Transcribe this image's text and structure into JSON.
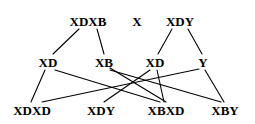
{
  "diagram": {
    "type": "derivation-lattice",
    "width": 255,
    "height": 124,
    "background_color": "#ffffff",
    "edge_color": "#000000",
    "text_color": "#000000",
    "rows": [
      {
        "name": "top-row",
        "y": 21,
        "nodes": [
          {
            "id": "n-xdxb",
            "label": "XDXB",
            "x": 88,
            "y": 21
          },
          {
            "id": "n-x",
            "label": "X",
            "x": 137,
            "y": 21
          },
          {
            "id": "n-xdy-top",
            "label": "XDY",
            "x": 180,
            "y": 21
          }
        ]
      },
      {
        "name": "middle-row",
        "y": 62,
        "nodes": [
          {
            "id": "n-xd-left",
            "label": "XD",
            "x": 48,
            "y": 62
          },
          {
            "id": "n-xb",
            "label": "XB",
            "x": 104,
            "y": 62
          },
          {
            "id": "n-xd-right",
            "label": "XD",
            "x": 155,
            "y": 62
          },
          {
            "id": "n-y",
            "label": "Y",
            "x": 203,
            "y": 62
          }
        ]
      },
      {
        "name": "bottom-row",
        "y": 110,
        "nodes": [
          {
            "id": "n-xdxd",
            "label": "XDXD",
            "x": 32,
            "y": 110
          },
          {
            "id": "n-xdy-bottom",
            "label": "XDY",
            "x": 101,
            "y": 110
          },
          {
            "id": "n-xbxd",
            "label": "XBXD",
            "x": 166,
            "y": 110
          },
          {
            "id": "n-xby",
            "label": "XBY",
            "x": 225,
            "y": 110
          }
        ]
      }
    ],
    "edges": [
      {
        "id": "e-1",
        "from": "n-xdxb",
        "to": "n-xd-left",
        "x1": 79,
        "y1": 29,
        "x2": 53,
        "y2": 54
      },
      {
        "id": "e-2",
        "from": "n-xdxb",
        "to": "n-xb",
        "x1": 97,
        "y1": 29,
        "x2": 104,
        "y2": 54
      },
      {
        "id": "e-3",
        "from": "n-xdy-top",
        "to": "n-xd-right",
        "x1": 172,
        "y1": 29,
        "x2": 158,
        "y2": 54
      },
      {
        "id": "e-4",
        "from": "n-xdy-top",
        "to": "n-y",
        "x1": 188,
        "y1": 29,
        "x2": 202,
        "y2": 54
      },
      {
        "id": "e-5",
        "from": "n-xd-left",
        "to": "n-xdxd",
        "x1": 45,
        "y1": 70,
        "x2": 31,
        "y2": 102
      },
      {
        "id": "e-6",
        "from": "n-xd-left",
        "to": "n-xbxd",
        "x1": 55,
        "y1": 70,
        "x2": 160,
        "y2": 102
      },
      {
        "id": "e-7",
        "from": "n-xb",
        "to": "n-xbxd",
        "x1": 110,
        "y1": 68,
        "x2": 166,
        "y2": 102
      },
      {
        "id": "e-8",
        "from": "n-xb",
        "to": "n-xby",
        "x1": 110,
        "y1": 70,
        "x2": 221,
        "y2": 102
      },
      {
        "id": "e-9",
        "from": "n-xd-right",
        "to": "n-xdy-bottom",
        "x1": 150,
        "y1": 70,
        "x2": 104,
        "y2": 102
      },
      {
        "id": "e-10",
        "from": "n-xd-right",
        "to": "n-xbxd",
        "x1": 157,
        "y1": 70,
        "x2": 164,
        "y2": 102
      },
      {
        "id": "e-11",
        "from": "n-y",
        "to": "n-xdxd",
        "x1": 199,
        "y1": 69,
        "x2": 42,
        "y2": 102
      },
      {
        "id": "e-12",
        "from": "n-y",
        "to": "n-xby",
        "x1": 205,
        "y1": 70,
        "x2": 224,
        "y2": 102
      }
    ]
  }
}
